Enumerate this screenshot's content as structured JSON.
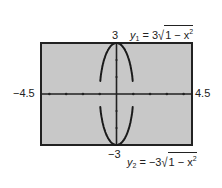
{
  "chart_data": {
    "type": "line",
    "title": "",
    "xlabel": "",
    "ylabel": "",
    "xlim": [
      -4.5,
      4.5
    ],
    "ylim": [
      -3,
      3
    ],
    "xscale": 1,
    "yscale": 1,
    "grid": false,
    "series": [
      {
        "name": "y1 = 3√(1 − x²)",
        "function": "3*sqrt(1-x^2)",
        "domain": [
          -1,
          1
        ]
      },
      {
        "name": "y2 = −3√(1 − x²)",
        "function": "-3*sqrt(1-x^2)",
        "domain": [
          -1,
          1
        ]
      }
    ],
    "annotations": [
      {
        "text": "y1 = 3√(1 − x²)",
        "position": "top-right"
      },
      {
        "text": "y2 = −3√(1 − x²)",
        "position": "bottom-right"
      }
    ]
  },
  "labels": {
    "xmin": "−4.5",
    "xmax": "4.5",
    "ymax": "3",
    "ymin": "−3"
  },
  "equations": {
    "y1": {
      "var": "y",
      "sub": "1",
      "coef": "= 3",
      "radicand": "1 −  x",
      "exp": "2"
    },
    "y2": {
      "var": "y",
      "sub": "2",
      "coef": "= −3",
      "radicand": "1 −  x",
      "exp": "2"
    }
  },
  "colors": {
    "window_fill": "#c8c8c8",
    "frame": "#222222",
    "curve": "#1a1a1a"
  }
}
